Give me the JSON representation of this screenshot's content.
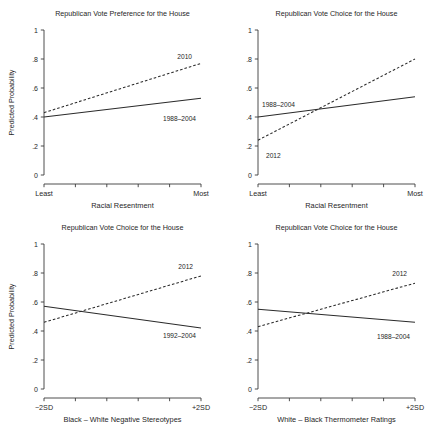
{
  "figure": {
    "panel_count": 4,
    "background": "#ffffff",
    "line_color": "#2a2a2a"
  },
  "chart_data": [
    {
      "id": "panel-top-left",
      "type": "line",
      "title": "Republican Vote Preference for the House",
      "xlabel": "Racial Resentment",
      "ylabel": "Predicted Probability",
      "xlim": [
        0,
        1
      ],
      "ylim": [
        0,
        1
      ],
      "grid": false,
      "legend": "inline-annotation",
      "yticks": [
        "0",
        ".2",
        ".4",
        ".6",
        ".8",
        "1"
      ],
      "ytick_values": [
        0,
        0.2,
        0.4,
        0.6,
        0.8,
        1
      ],
      "xtick_labels": [
        "Least",
        "Most"
      ],
      "xtick_count_interior": 4,
      "series": [
        {
          "name": "1988–2004",
          "style": "solid",
          "x": [
            0,
            1
          ],
          "values": [
            0.4,
            0.53
          ]
        },
        {
          "name": "2010",
          "style": "dashed",
          "x": [
            0,
            1
          ],
          "values": [
            0.43,
            0.77
          ]
        }
      ]
    },
    {
      "id": "panel-top-right",
      "type": "line",
      "title": "Republican Vote Choice for the House",
      "xlabel": "Racial Resentment",
      "ylabel": "",
      "xlim": [
        0,
        1
      ],
      "ylim": [
        0,
        1
      ],
      "grid": false,
      "legend": "inline-annotation",
      "yticks": [
        "0",
        ".2",
        ".4",
        ".6",
        ".8",
        "1"
      ],
      "ytick_values": [
        0,
        0.2,
        0.4,
        0.6,
        0.8,
        1
      ],
      "xtick_labels": [
        "Least",
        "Most"
      ],
      "xtick_count_interior": 4,
      "series": [
        {
          "name": "1988–2004",
          "style": "solid",
          "x": [
            0,
            1
          ],
          "values": [
            0.4,
            0.54
          ]
        },
        {
          "name": "2012",
          "style": "dashed",
          "x": [
            0,
            1
          ],
          "values": [
            0.24,
            0.8
          ]
        }
      ]
    },
    {
      "id": "panel-bottom-left",
      "type": "line",
      "title": "Republican Vote Choice for the House",
      "xlabel": "Black – White Negative Stereotypes",
      "ylabel": "Predicted Probability",
      "xlim": [
        0,
        1
      ],
      "ylim": [
        0,
        1
      ],
      "grid": false,
      "legend": "inline-annotation",
      "yticks": [
        "0",
        ".2",
        ".4",
        ".6",
        ".8",
        "1"
      ],
      "ytick_values": [
        0,
        0.2,
        0.4,
        0.6,
        0.8,
        1
      ],
      "xtick_labels": [
        "−2SD",
        "+2SD"
      ],
      "xtick_count_interior": 4,
      "series": [
        {
          "name": "1992–2004",
          "style": "solid",
          "x": [
            0,
            1
          ],
          "values": [
            0.57,
            0.42
          ]
        },
        {
          "name": "2012",
          "style": "dashed",
          "x": [
            0,
            1
          ],
          "values": [
            0.46,
            0.78
          ]
        }
      ]
    },
    {
      "id": "panel-bottom-right",
      "type": "line",
      "title": "Republican Vote Choice for the House",
      "xlabel": "White – Black Thermometer Ratings",
      "ylabel": "",
      "xlim": [
        0,
        1
      ],
      "ylim": [
        0,
        1
      ],
      "grid": false,
      "legend": "inline-annotation",
      "yticks": [
        "0",
        ".2",
        ".4",
        ".6",
        ".8",
        "1"
      ],
      "ytick_values": [
        0,
        0.2,
        0.4,
        0.6,
        0.8,
        1
      ],
      "xtick_labels": [
        "−2SD",
        "+2SD"
      ],
      "xtick_count_interior": 4,
      "series": [
        {
          "name": "1988–2004",
          "style": "solid",
          "x": [
            0,
            1
          ],
          "values": [
            0.55,
            0.46
          ]
        },
        {
          "name": "2012",
          "style": "dashed",
          "x": [
            0,
            1
          ],
          "values": [
            0.43,
            0.73
          ]
        }
      ]
    }
  ]
}
